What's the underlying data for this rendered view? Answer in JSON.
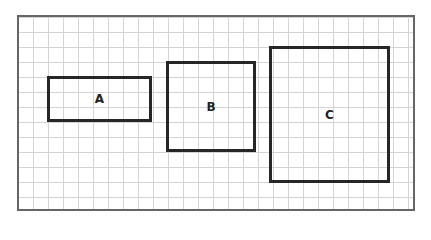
{
  "diagram": {
    "boxes": [
      {
        "label": "A",
        "left": 47,
        "top": 76,
        "width": 105,
        "height": 46
      },
      {
        "label": "B",
        "left": 166,
        "top": 61,
        "width": 90,
        "height": 91
      },
      {
        "label": "C",
        "left": 269,
        "top": 46,
        "width": 121,
        "height": 137
      }
    ],
    "grid": {
      "cell_size": 15,
      "line_color": "#d4d4d4",
      "border_color": "#666666",
      "box_color": "#262626"
    }
  }
}
